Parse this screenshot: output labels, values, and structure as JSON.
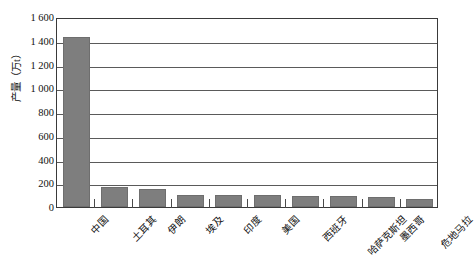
{
  "chart_data": {
    "type": "bar",
    "title": "",
    "xlabel": "",
    "ylabel": "产量（万t）",
    "ylim": [
      0,
      1600
    ],
    "ytick_step": 200,
    "ytick_labels": [
      "1 600",
      "1 400",
      "1 200",
      "1 000",
      "800",
      "600",
      "400",
      "200",
      "0"
    ],
    "ytick_values": [
      1600,
      1400,
      1200,
      1000,
      800,
      600,
      400,
      200,
      0
    ],
    "grid": true,
    "legend": "none",
    "bar_color": "#7e7e7e",
    "categories": [
      "中国",
      "土耳其",
      "伊朗",
      "埃及",
      "印度",
      "美国",
      "西班牙",
      "哈萨克斯坦",
      "墨西哥",
      "危地马拉"
    ],
    "values": [
      1430,
      170,
      155,
      105,
      100,
      100,
      95,
      90,
      85,
      70
    ]
  }
}
